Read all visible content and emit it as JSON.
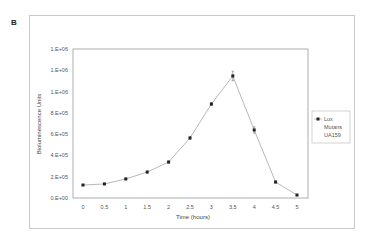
{
  "panel_label": "B",
  "chart_data": {
    "type": "line",
    "title": "",
    "xlabel": "Time (hours)",
    "ylabel": "Bioluminescence Units",
    "categories": [
      "0",
      "0.5",
      "1",
      "1.5",
      "2",
      "2.5",
      "3",
      "3.5",
      "4",
      "4.5",
      "5"
    ],
    "series": [
      {
        "name": "Lux Mutans UA159",
        "values": [
          122000,
          132000,
          179000,
          244000,
          338000,
          564000,
          883000,
          1147000,
          639000,
          150000,
          28000
        ],
        "error": [
          5000,
          5000,
          8000,
          8000,
          10000,
          12000,
          15000,
          45000,
          30000,
          10000,
          5000
        ]
      }
    ],
    "ylim": [
      0,
      1400000
    ],
    "yticks": [
      0,
      200000,
      400000,
      600000,
      800000,
      1000000,
      1200000,
      1400000
    ],
    "ytick_labels": [
      "0.E+00",
      "2.E+05",
      "4.E+05",
      "6.E+05",
      "8.E+05",
      "1.E+06",
      "1.E+06",
      "1.E+06"
    ],
    "grid": false,
    "legend_position": "right",
    "legend": [
      "Lux Mutans UA159"
    ]
  },
  "legend": {
    "line1": "Lux",
    "line2": "Mutans",
    "line3": "UA159"
  },
  "colors": {
    "line": "#b0b0b0",
    "marker": "#222222",
    "axis": "#999999"
  }
}
